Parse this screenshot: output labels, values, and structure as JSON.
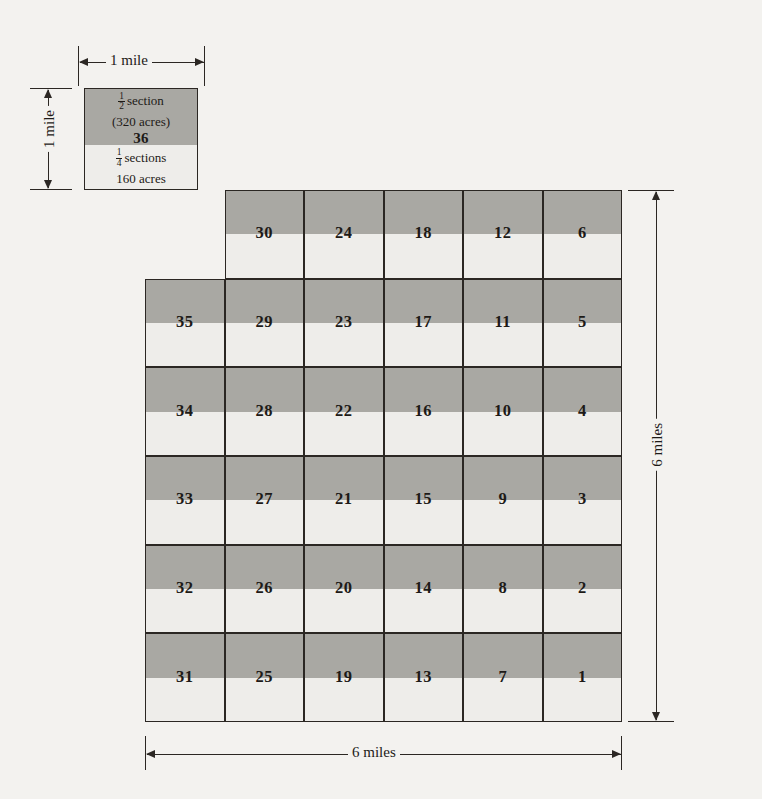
{
  "diagram": {
    "colors": {
      "background": "#f3f2ef",
      "band_dark": "#a9a8a3",
      "band_light": "#eeedea",
      "ink": "#1d1a17",
      "border": "#2b2723"
    }
  },
  "legend": {
    "half_section_fraction_num": "1",
    "half_section_fraction_den": "2",
    "half_section_label": "section",
    "half_section_acres": "(320 acres)",
    "section_number": "36",
    "quarter_section_fraction_num": "1",
    "quarter_section_fraction_den": "4",
    "quarter_section_label": "sections",
    "quarter_section_acres": "160 acres"
  },
  "dimensions": {
    "top_width": "1 mile",
    "left_height": "1 mile",
    "bottom_width": "6 miles",
    "right_height": "6 miles"
  },
  "grid": {
    "rows": 6,
    "cols": 6,
    "cells": [
      {
        "row": 1,
        "col": 1,
        "label": "36",
        "is_legend": true
      },
      {
        "row": 1,
        "col": 2,
        "label": "30",
        "is_legend": false
      },
      {
        "row": 1,
        "col": 3,
        "label": "24",
        "is_legend": false
      },
      {
        "row": 1,
        "col": 4,
        "label": "18",
        "is_legend": false
      },
      {
        "row": 1,
        "col": 5,
        "label": "12",
        "is_legend": false
      },
      {
        "row": 1,
        "col": 6,
        "label": "6",
        "is_legend": false
      },
      {
        "row": 2,
        "col": 1,
        "label": "35",
        "is_legend": false
      },
      {
        "row": 2,
        "col": 2,
        "label": "29",
        "is_legend": false
      },
      {
        "row": 2,
        "col": 3,
        "label": "23",
        "is_legend": false
      },
      {
        "row": 2,
        "col": 4,
        "label": "17",
        "is_legend": false
      },
      {
        "row": 2,
        "col": 5,
        "label": "11",
        "is_legend": false
      },
      {
        "row": 2,
        "col": 6,
        "label": "5",
        "is_legend": false
      },
      {
        "row": 3,
        "col": 1,
        "label": "34",
        "is_legend": false
      },
      {
        "row": 3,
        "col": 2,
        "label": "28",
        "is_legend": false
      },
      {
        "row": 3,
        "col": 3,
        "label": "22",
        "is_legend": false
      },
      {
        "row": 3,
        "col": 4,
        "label": "16",
        "is_legend": false
      },
      {
        "row": 3,
        "col": 5,
        "label": "10",
        "is_legend": false
      },
      {
        "row": 3,
        "col": 6,
        "label": "4",
        "is_legend": false
      },
      {
        "row": 4,
        "col": 1,
        "label": "33",
        "is_legend": false
      },
      {
        "row": 4,
        "col": 2,
        "label": "27",
        "is_legend": false
      },
      {
        "row": 4,
        "col": 3,
        "label": "21",
        "is_legend": false
      },
      {
        "row": 4,
        "col": 4,
        "label": "15",
        "is_legend": false
      },
      {
        "row": 4,
        "col": 5,
        "label": "9",
        "is_legend": false
      },
      {
        "row": 4,
        "col": 6,
        "label": "3",
        "is_legend": false
      },
      {
        "row": 5,
        "col": 1,
        "label": "32",
        "is_legend": false
      },
      {
        "row": 5,
        "col": 2,
        "label": "26",
        "is_legend": false
      },
      {
        "row": 5,
        "col": 3,
        "label": "20",
        "is_legend": false
      },
      {
        "row": 5,
        "col": 4,
        "label": "14",
        "is_legend": false
      },
      {
        "row": 5,
        "col": 5,
        "label": "8",
        "is_legend": false
      },
      {
        "row": 5,
        "col": 6,
        "label": "2",
        "is_legend": false
      },
      {
        "row": 6,
        "col": 1,
        "label": "31",
        "is_legend": false
      },
      {
        "row": 6,
        "col": 2,
        "label": "25",
        "is_legend": false
      },
      {
        "row": 6,
        "col": 3,
        "label": "19",
        "is_legend": false
      },
      {
        "row": 6,
        "col": 4,
        "label": "13",
        "is_legend": false
      },
      {
        "row": 6,
        "col": 5,
        "label": "7",
        "is_legend": false
      },
      {
        "row": 6,
        "col": 6,
        "label": "1",
        "is_legend": false
      }
    ]
  }
}
